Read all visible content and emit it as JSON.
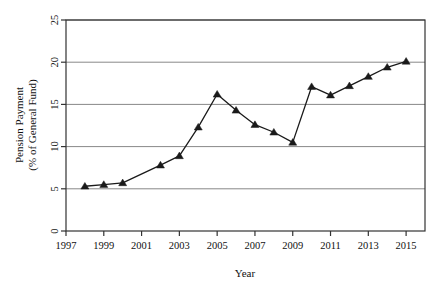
{
  "chart_data": {
    "type": "line",
    "title": "",
    "xlabel": "Year",
    "ylabel": "Pension Payment\n(% of General Fund)",
    "ylabel_line1": "Pension Payment",
    "ylabel_line2": "(% of General Fund)",
    "x": [
      1998,
      1999,
      2000,
      2002,
      2003,
      2004,
      2005,
      2006,
      2007,
      2008,
      2009,
      2010,
      2011,
      2012,
      2013,
      2014,
      2015
    ],
    "values": [
      5.3,
      5.5,
      5.7,
      7.8,
      8.9,
      12.3,
      16.2,
      14.3,
      12.6,
      11.7,
      10.5,
      17.1,
      16.1,
      17.2,
      18.3,
      19.4,
      20.1
    ],
    "series": [
      {
        "name": "Pension Payment",
        "values": [
          5.3,
          5.5,
          5.7,
          7.8,
          8.9,
          12.3,
          16.2,
          14.3,
          12.6,
          11.7,
          10.5,
          17.1,
          16.1,
          17.2,
          18.3,
          19.4,
          20.1
        ]
      }
    ],
    "xlim": [
      1997,
      2016
    ],
    "ylim": [
      0,
      25
    ],
    "xticks": [
      1997,
      1999,
      2001,
      2003,
      2005,
      2007,
      2009,
      2011,
      2013,
      2015
    ],
    "xtick_labels": [
      "1997",
      "1999",
      "2001",
      "2003",
      "2005",
      "2007",
      "2009",
      "2011",
      "2013",
      "2015"
    ],
    "yticks": [
      0,
      5,
      10,
      15,
      20,
      25
    ],
    "ytick_labels": [
      "0",
      "5",
      "10",
      "15",
      "20",
      "25"
    ],
    "grid": "horizontal",
    "legend": "none",
    "marker": "triangle",
    "line_color": "#1a1a1a",
    "marker_color": "#1a1a1a",
    "grid_color": "#888888",
    "axis_color": "#333333",
    "background": "#ffffff"
  }
}
